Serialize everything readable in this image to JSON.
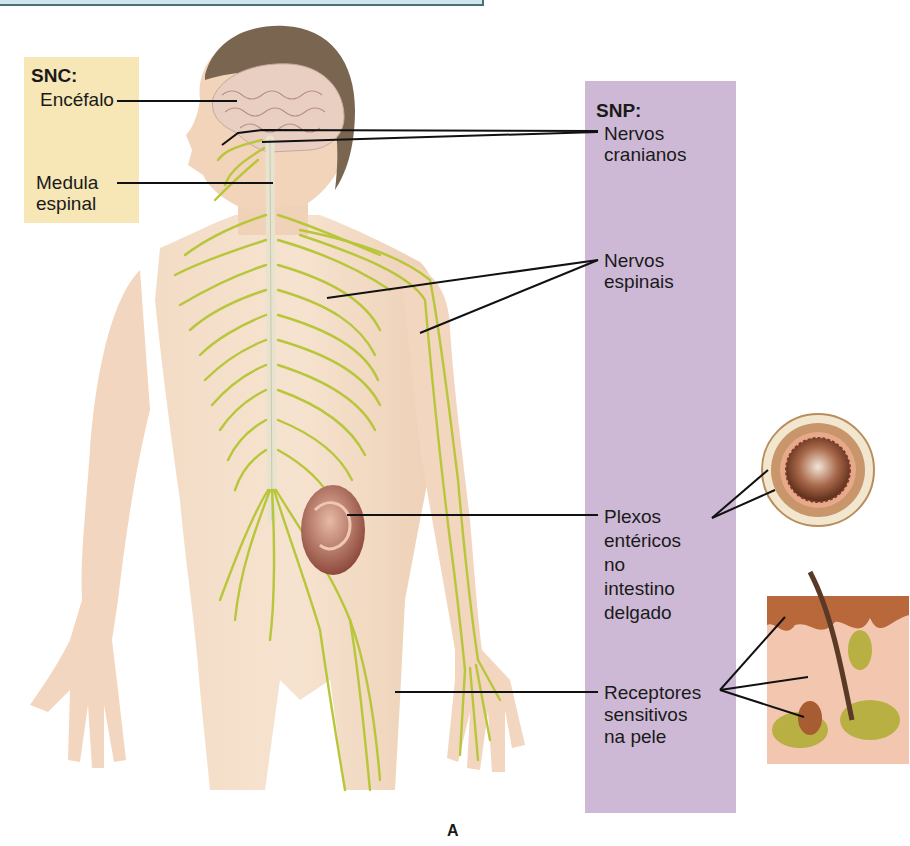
{
  "figure": {
    "letter": "A",
    "colors": {
      "snc_box": "#f7e6b6",
      "snp_box": "#cdb9d6",
      "nerve": "#b7c63a",
      "skin": "#f1d6bd",
      "hair": "#7a6650",
      "leader_line": "#111111",
      "top_rule": "#4f6f77"
    }
  },
  "snc": {
    "title": "SNC:",
    "labels": [
      {
        "text": "Encéfalo"
      },
      {
        "text": "Medula\nespinal"
      }
    ]
  },
  "snp": {
    "title": "SNP:",
    "labels": [
      {
        "text": "Nervos\ncranianos"
      },
      {
        "text": "Nervos\nespinais"
      },
      {
        "text": "Plexos\nentéricos\nno\nintestino\ndelgado"
      },
      {
        "text": "Receptores\nsensitivos\nna pele"
      }
    ]
  },
  "insets": [
    {
      "name": "small-intestine-cross-section"
    },
    {
      "name": "skin-section-with-receptors"
    }
  ]
}
